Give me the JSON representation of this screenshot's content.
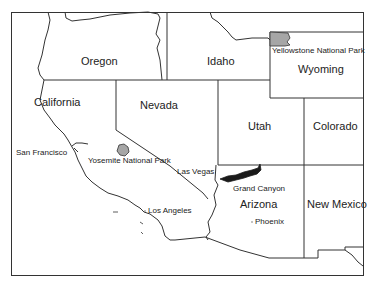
{
  "map": {
    "type": "regional-outline-map",
    "region": "Western United States",
    "colors": {
      "background": "#ffffff",
      "border": "#333333",
      "park_fill": "#a6a6a6",
      "grand_canyon_fill": "#1a1a1a"
    },
    "states": [
      {
        "name": "Oregon"
      },
      {
        "name": "Idaho"
      },
      {
        "name": "Wyoming"
      },
      {
        "name": "California"
      },
      {
        "name": "Nevada"
      },
      {
        "name": "Utah"
      },
      {
        "name": "Colorado"
      },
      {
        "name": "Arizona"
      },
      {
        "name": "New Mexico"
      }
    ],
    "cities": [
      {
        "name": "San Francisco"
      },
      {
        "name": "Las Vegas"
      },
      {
        "name": "Los Angeles"
      },
      {
        "name": "Phoenix"
      }
    ],
    "parks": [
      {
        "name": "Yellowstone National Park"
      },
      {
        "name": "Yosemite National Park"
      },
      {
        "name": "Grand Canyon"
      }
    ]
  }
}
